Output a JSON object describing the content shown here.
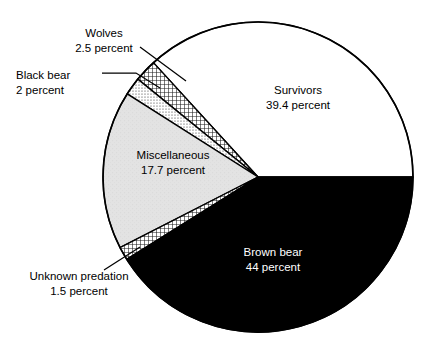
{
  "chart_data": {
    "type": "pie",
    "title": "",
    "subtitle": "",
    "xlabel": "",
    "ylabel": "",
    "legend_position": "none",
    "grid": false,
    "units": "percent",
    "start_angle_deg": 0,
    "direction": "counterclockwise",
    "total_percent": 107.1,
    "categories": [
      "Survivors",
      "Wolves",
      "Black bear",
      "Miscellaneous",
      "Unknown predation",
      "Brown bear"
    ],
    "values": [
      39.4,
      2.5,
      2,
      17.7,
      1.5,
      44
    ],
    "value_labels": [
      "39.4 percent",
      "2.5 percent",
      "2 percent",
      "17.7 percent",
      "1.5 percent",
      "44 percent"
    ],
    "slices": [
      {
        "name": "Survivors",
        "value": 39.4,
        "value_label": "39.4 percent",
        "fill": "white",
        "fill_color": "#ffffff",
        "label_placement": "inside",
        "text_color": "#000000",
        "leader_line": false
      },
      {
        "name": "Wolves",
        "value": 2.5,
        "value_label": "2.5 percent",
        "fill": "crosshatch",
        "fill_color": "#ffffff",
        "label_placement": "outside",
        "text_color": "#000000",
        "leader_line": true
      },
      {
        "name": "Black bear",
        "value": 2,
        "value_label": "2 percent",
        "fill": "dotted",
        "fill_color": "#ffffff",
        "label_placement": "outside",
        "text_color": "#000000",
        "leader_line": true
      },
      {
        "name": "Miscellaneous",
        "value": 17.7,
        "value_label": "17.7 percent",
        "fill": "light-gray",
        "fill_color": "#e3e3e3",
        "label_placement": "inside",
        "text_color": "#000000",
        "leader_line": false
      },
      {
        "name": "Unknown predation",
        "value": 1.5,
        "value_label": "1.5 percent",
        "fill": "crosshatch",
        "fill_color": "#ffffff",
        "label_placement": "outside",
        "text_color": "#000000",
        "leader_line": true
      },
      {
        "name": "Brown bear",
        "value": 44,
        "value_label": "44 percent",
        "fill": "solid-black",
        "fill_color": "#000000",
        "label_placement": "inside",
        "text_color": "#ffffff",
        "leader_line": false
      }
    ],
    "colors": {
      "outline": "#000000",
      "black_slice": "#000000",
      "gray_slice": "#e3e3e3",
      "white_slice": "#ffffff",
      "background": "#ffffff",
      "text": "#000000",
      "text_on_black": "#ffffff"
    }
  },
  "labels": {
    "wolves": {
      "name": "Wolves",
      "value": "2.5 percent"
    },
    "black_bear": {
      "name": "Black bear",
      "value": "2 percent"
    },
    "survivors": {
      "name": "Survivors",
      "value": "39.4 percent"
    },
    "misc": {
      "name": "Miscellaneous",
      "value": "17.7 percent"
    },
    "unknown": {
      "name": "Unknown predation",
      "value": "1.5 percent"
    },
    "brown_bear": {
      "name": "Brown bear",
      "value": "44 percent"
    }
  }
}
